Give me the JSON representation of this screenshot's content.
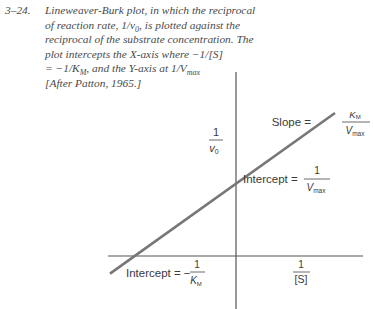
{
  "caption": {
    "figure_number": "3–24.",
    "lines": [
      "Lineweaver-Burk plot, in which the reciprocal",
      "of reaction rate, 1/v",
      "reciprocal of the substrate concentration. The",
      "plot intercepts the X-axis where −1/[S]",
      "= −1/K",
      "[After Patton, 1965.]"
    ],
    "line2_sub": "0",
    "line2_tail": ", is plotted against the",
    "line5_sub": "M",
    "line5_tail": ", and the Y-axis at 1/V",
    "line5_sub2": "max"
  },
  "chart_data": {
    "type": "line",
    "title": "Lineweaver-Burk plot",
    "xlabel": "1/[S]",
    "ylabel": "1/v0",
    "xlim": [
      -1.4,
      1.5
    ],
    "ylim": [
      -0.5,
      1.5
    ],
    "series": [
      {
        "name": "1/v0 vs 1/[S]",
        "x": [
          -1.4,
          1.1
        ],
        "y": [
          -0.16,
          1.3
        ]
      }
    ],
    "annotations": {
      "slope": {
        "prefix": "Slope = ",
        "num": "K",
        "num_sub": "M",
        "den": "V",
        "den_sub": "max"
      },
      "y_intercept": {
        "prefix": "Intercept = ",
        "num": "1",
        "den": "V",
        "den_sub": "max"
      },
      "x_intercept": {
        "prefix": "Intercept = −",
        "num": "1",
        "den": "K",
        "den_sub": "M"
      },
      "y_axis_label": {
        "num": "1",
        "den": "v",
        "den_sub": "0"
      },
      "x_axis_label": {
        "num": "1",
        "den": "[S]"
      }
    },
    "grid": false,
    "legend": "none"
  }
}
